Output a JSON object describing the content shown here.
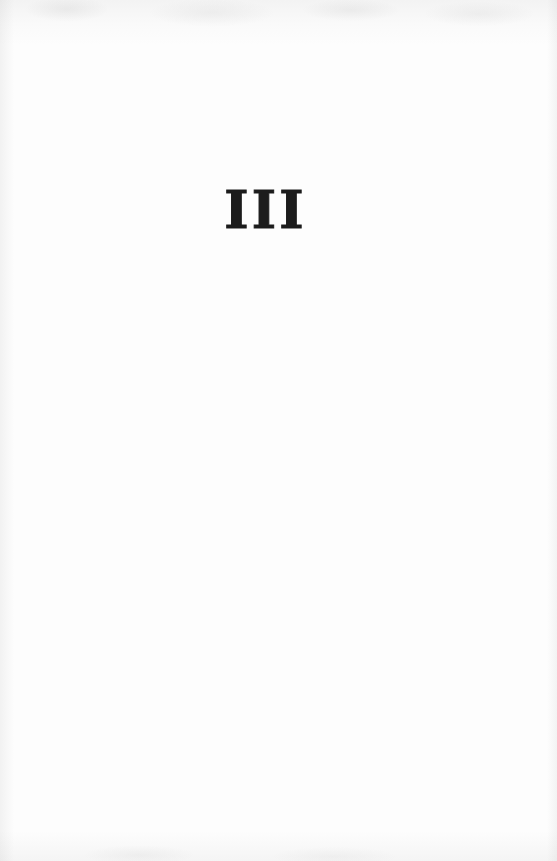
{
  "page": {
    "section_numeral": "III"
  },
  "colors": {
    "ink": "#1c1c1c",
    "paper": "#fdfdfd",
    "edge_tint": "#e9e9e9"
  }
}
